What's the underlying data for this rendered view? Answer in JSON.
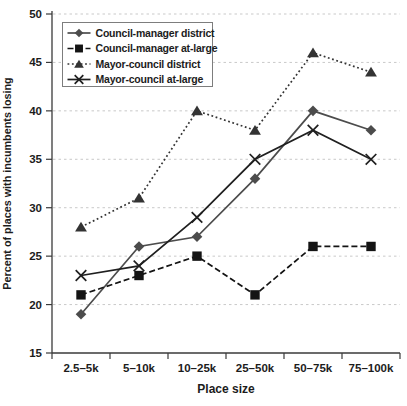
{
  "figure": {
    "background": "#ffffff"
  },
  "chart_data": {
    "type": "line",
    "title": "",
    "xlabel": "Place size",
    "ylabel": "Percent of places with incumbents losing",
    "categories": [
      "2.5–5k",
      "5–10k",
      "10–25k",
      "25–50k",
      "50–75k",
      "75–100k"
    ],
    "ylim": [
      15,
      50
    ],
    "yticks": [
      15,
      20,
      25,
      30,
      35,
      40,
      45,
      50
    ],
    "grid": "horizontal-dashed",
    "legend_position": "top-left",
    "series": [
      {
        "name": "Council-manager district",
        "marker": "diamond",
        "line_style": "solid",
        "color": "#4c4c4c",
        "values": [
          19,
          26,
          27,
          33,
          40,
          38
        ]
      },
      {
        "name": "Council-manager at-large",
        "marker": "square",
        "line_style": "dashed",
        "color": "#141414",
        "values": [
          21,
          23,
          25,
          21,
          26,
          26
        ]
      },
      {
        "name": "Mayor-council district",
        "marker": "triangle",
        "line_style": "dotted",
        "color": "#333333",
        "values": [
          28,
          31,
          40,
          38,
          46,
          44
        ]
      },
      {
        "name": "Mayor-council at-large",
        "marker": "x",
        "line_style": "solid",
        "color": "#1f1f1f",
        "values": [
          23,
          24,
          29,
          35,
          38,
          35
        ]
      }
    ],
    "colors": {
      "axis": "#3a3a3a",
      "text": "#1c1c1c",
      "grid": "#c9c9c9",
      "legend_border": "#7d7d7d"
    }
  }
}
